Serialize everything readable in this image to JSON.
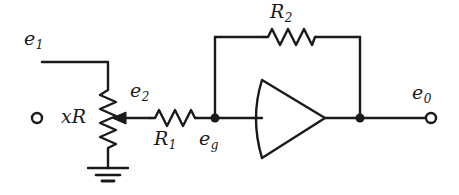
{
  "figure": {
    "kind": "electronic-schematic",
    "stroke_color": "#1a1a1a",
    "background_color": "#ffffff",
    "width": 459,
    "height": 195
  },
  "labels": {
    "input_terminal": {
      "symbol": "e",
      "subscript": "1",
      "x": 24,
      "y": 29
    },
    "potentiometer": {
      "symbol": "xR",
      "subscript": "",
      "x": 61,
      "y": 107
    },
    "wiper_node": {
      "symbol": "e",
      "subscript": "2",
      "x": 130,
      "y": 81
    },
    "input_resistor": {
      "symbol": "R",
      "subscript": "1",
      "x": 154,
      "y": 129
    },
    "grid_node": {
      "symbol": "e",
      "subscript": "g",
      "x": 199,
      "y": 129
    },
    "feedback_resistor": {
      "symbol": "R",
      "subscript": "2",
      "x": 270,
      "y": 2
    },
    "output_terminal": {
      "symbol": "e",
      "subscript": "0",
      "x": 412,
      "y": 83
    }
  },
  "components": {
    "potentiometer_xr": {
      "name": "xR",
      "type": "variable-resistor",
      "orientation": "vertical",
      "x": 108,
      "y_top": 85,
      "y_bottom": 150
    },
    "resistor_r1": {
      "name": "R1",
      "type": "resistor",
      "orientation": "horizontal",
      "y": 118,
      "x_left": 150,
      "x_right": 196
    },
    "resistor_r2": {
      "name": "R2",
      "type": "resistor",
      "orientation": "horizontal",
      "y": 37,
      "x_left": 264,
      "x_right": 316
    },
    "amplifier": {
      "name": "operational-amplifier",
      "type": "triangle-with-concave-left-edge",
      "left_x": 262,
      "apex_x": 325,
      "top_y": 80,
      "bottom_y": 158,
      "center_y": 118,
      "concave_bulge_x": 251
    },
    "ground": {
      "name": "ground",
      "type": "earth-ground",
      "x": 108,
      "y_top": 168,
      "bars": 3
    },
    "wiper_arrow": {
      "name": "potentiometer-wiper",
      "direction": "left",
      "tip_x": 112,
      "tail_x": 150,
      "y": 118
    }
  },
  "terminals": {
    "input": {
      "name": "e1-terminal",
      "x": 37,
      "y": 118,
      "radius": 5,
      "style": "open-circle"
    },
    "output": {
      "name": "e0-terminal",
      "x": 431,
      "y": 118,
      "radius": 5,
      "style": "open-circle"
    }
  },
  "junctions": {
    "grid_node": {
      "name": "eg-junction",
      "x": 215,
      "y": 118,
      "radius": 4.5,
      "style": "filled-dot"
    },
    "output_node": {
      "name": "output-junction",
      "x": 360,
      "y": 118,
      "radius": 4.5,
      "style": "filled-dot"
    }
  },
  "wires": {
    "input_to_pot_top": "from e1 terminal right to x=108 then down to potentiometer top",
    "wiper_to_r1": "from wiper arrow tip right through R1 to eg node",
    "eg_to_amp_input": "from eg node right to amplifier left edge",
    "eg_up_to_feedback": "from eg node up to y=37 (feedback top rail)",
    "feedback_rail": "from x=215 right through R2 to x=360 at y=37",
    "output_down": "from x=360 y=37 down to output node at y=118",
    "amp_to_output": "from amplifier apex right to output node and on to e0 terminal",
    "pot_to_ground": "from potentiometer bottom down to ground symbol"
  }
}
